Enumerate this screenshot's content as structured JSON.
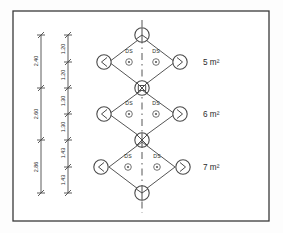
{
  "figure": {
    "frame": {
      "stroke_color": "#3a3a3a",
      "background": "#ffffff"
    },
    "centerline": {
      "label": "vertical-centerline",
      "style": "dash-dot"
    }
  },
  "rows": [
    {
      "id": "row-1",
      "area_label": "5 m²",
      "ds_left": "DS",
      "ds_right": "DS"
    },
    {
      "id": "row-2",
      "area_label": "6 m²",
      "ds_left": "DS",
      "ds_right": "DS"
    },
    {
      "id": "row-3",
      "area_label": "7 m²",
      "ds_left": "DS",
      "ds_right": "DS"
    }
  ],
  "dimensions": {
    "outer_chain_name": "overall-spacing-chain",
    "inner_chain_name": "half-spacing-chain",
    "outer": [
      "2.40",
      "2.60",
      "2.86"
    ],
    "inner": [
      "1.20",
      "1.20",
      "1.30",
      "1.30",
      "1.43",
      "1.43"
    ]
  },
  "nodes": {
    "left_glyph": "arrow-left",
    "right_glyph": "arrow-right",
    "junction_glyph": "cross-junction",
    "top_glyph": "tee-junction",
    "bottom_glyph": "tee-junction"
  }
}
